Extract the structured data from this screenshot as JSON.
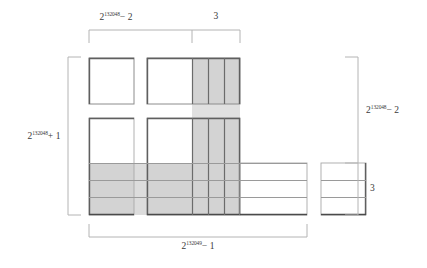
{
  "figure": {
    "title_caption": "",
    "colors": {
      "shade": "#d3d3d3",
      "shade_light": "#dcdcdc",
      "stroke_dark": "#595959",
      "stroke_light": "#a8a8a8",
      "bracket": "#b4b4b4",
      "text": "#3a3a3a",
      "background": "#ffffff"
    }
  },
  "labels": {
    "top_left": {
      "base": "2",
      "exponent": "132048",
      "suffix": "− 2",
      "full": "2^132048 − 2"
    },
    "top_right": {
      "full": "3"
    },
    "left": {
      "base": "2",
      "exponent": "132048",
      "suffix": "+ 1",
      "full": "2^132048 + 1"
    },
    "right_upper": {
      "base": "2",
      "exponent": "132048",
      "suffix": "− 2",
      "full": "2^132048 − 2"
    },
    "right_lower": {
      "full": "3"
    },
    "bottom": {
      "base": "2",
      "exponent": "132049",
      "suffix": "− 1",
      "full": "2^132049 − 1"
    }
  },
  "brackets": {
    "top": {
      "x1": 89,
      "x2": 240,
      "y": 30,
      "tick": 13,
      "divider_x": 192
    },
    "left": {
      "y1": 57,
      "y2": 215,
      "x": 68,
      "tick": 13
    },
    "right": {
      "y1": 57,
      "y2": 215,
      "x": 358,
      "tick": 13,
      "divider_y": 163
    },
    "bottom": {
      "x1": 89,
      "x2": 307,
      "y": 237,
      "tick": 13
    }
  },
  "blocks": {
    "top_left_square": {
      "x": 89,
      "y": 58,
      "w": 45,
      "h": 46,
      "fill": "none"
    },
    "top_right_block": {
      "x": 147,
      "y": 58,
      "w": 93,
      "h": 46,
      "fill": "none"
    },
    "mid_left_block": {
      "x": 89,
      "y": 118,
      "w": 45,
      "h": 46,
      "fill": "none"
    },
    "mid_right_block": {
      "x": 147,
      "y": 118,
      "w": 93,
      "h": 46,
      "fill": "none"
    },
    "bottom_left_strip": {
      "x": 89,
      "y": 163,
      "w": 45,
      "h": 52,
      "fill": "shade"
    },
    "bottom_mid_strip": {
      "x": 147,
      "y": 163,
      "w": 160,
      "h": 52,
      "fill": "partial"
    },
    "bottom_right_block": {
      "x": 321,
      "y": 163,
      "w": 45,
      "h": 52,
      "fill": "none"
    },
    "vertical_shaded_strip": {
      "x": 192,
      "y": 58,
      "w": 48,
      "h": 157,
      "fill": "shade"
    },
    "gap_bridge": {
      "x": 192,
      "y": 104,
      "w": 48,
      "h": 14,
      "fill": "shade_light"
    }
  },
  "grid": {
    "vertical_dividers_x": [
      208,
      224
    ],
    "horizontal_dividers_y": [
      180,
      197
    ],
    "column_count": 3,
    "row_count": 3
  }
}
